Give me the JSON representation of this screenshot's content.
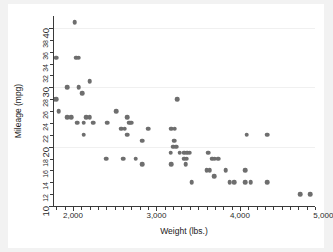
{
  "chart_data": {
    "type": "scatter",
    "title": "",
    "xlabel": "Weight (lbs.)",
    "ylabel": "Mileage (mpg)",
    "xlim": [
      1760,
      4900
    ],
    "ylim": [
      10,
      42
    ],
    "grid": true,
    "legend": null,
    "marker_color": "#6e6e6e",
    "background_color": "#ffffff",
    "page_color": "#f2f2f2",
    "axis_color": "#3a3a3a",
    "x_major_ticks": [
      2000,
      3000,
      4000,
      5000
    ],
    "x_major_tick_labels": [
      "2,000",
      "3,000",
      "4,000",
      "5,000"
    ],
    "x_minor_tick_step": 100,
    "y_major_ticks": [
      10,
      20,
      30,
      40
    ],
    "y_major_tick_labels": [
      "10",
      "20",
      "30",
      "40"
    ],
    "y_minor_ticks": [
      12,
      14,
      16,
      18,
      22,
      24,
      26,
      28,
      32,
      34,
      36,
      38
    ],
    "y_minor_tick_labels": [
      "12",
      "14",
      "16",
      "18",
      "22",
      "24",
      "26",
      "28",
      "32",
      "34",
      "36",
      "38"
    ],
    "gridline_values": [
      20,
      30,
      40
    ],
    "series": [
      {
        "name": "Automobiles",
        "points": [
          [
            2020,
            41
          ],
          [
            2040,
            35
          ],
          [
            2070,
            35
          ],
          [
            1800,
            35
          ],
          [
            1760,
            28
          ],
          [
            1800,
            28
          ],
          [
            1930,
            30
          ],
          [
            2070,
            30
          ],
          [
            2200,
            31
          ],
          [
            2110,
            29
          ],
          [
            1830,
            26
          ],
          [
            1930,
            25
          ],
          [
            1980,
            25
          ],
          [
            2160,
            25
          ],
          [
            2200,
            25
          ],
          [
            2240,
            24
          ],
          [
            2050,
            24
          ],
          [
            2130,
            24
          ],
          [
            2410,
            24
          ],
          [
            2130,
            22
          ],
          [
            2520,
            26
          ],
          [
            2650,
            25
          ],
          [
            2670,
            24
          ],
          [
            2700,
            24
          ],
          [
            2580,
            23
          ],
          [
            2620,
            23
          ],
          [
            2650,
            22
          ],
          [
            2900,
            23
          ],
          [
            2830,
            21
          ],
          [
            2750,
            18
          ],
          [
            2400,
            18
          ],
          [
            2600,
            18
          ],
          [
            2830,
            17
          ],
          [
            3250,
            28
          ],
          [
            3180,
            23
          ],
          [
            3220,
            23
          ],
          [
            3210,
            21
          ],
          [
            3200,
            20
          ],
          [
            3240,
            20
          ],
          [
            3170,
            19
          ],
          [
            3280,
            19
          ],
          [
            3330,
            19
          ],
          [
            3370,
            19
          ],
          [
            3400,
            19
          ],
          [
            3330,
            18
          ],
          [
            3360,
            18
          ],
          [
            3180,
            17
          ],
          [
            3350,
            17
          ],
          [
            3620,
            19
          ],
          [
            3670,
            18
          ],
          [
            3700,
            18
          ],
          [
            3740,
            18
          ],
          [
            3600,
            16
          ],
          [
            3640,
            16
          ],
          [
            3690,
            15
          ],
          [
            3830,
            16
          ],
          [
            4060,
            16
          ],
          [
            4080,
            22
          ],
          [
            4330,
            22
          ],
          [
            3420,
            14
          ],
          [
            3880,
            14
          ],
          [
            3930,
            14
          ],
          [
            4060,
            14
          ],
          [
            4130,
            14
          ],
          [
            4330,
            14
          ],
          [
            4720,
            12
          ],
          [
            4840,
            12
          ]
        ]
      }
    ]
  },
  "axes": {
    "y_title": "Mileage (mpg)",
    "x_title": "Weight (lbs.)"
  }
}
